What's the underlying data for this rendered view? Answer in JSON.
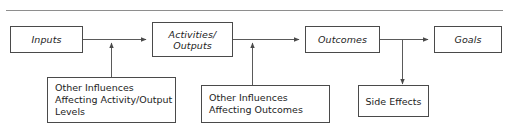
{
  "diagram": {
    "title_partial": "",
    "stages": [
      {
        "id": "inputs",
        "label": "Inputs"
      },
      {
        "id": "activities",
        "label": "Activities/\nOutputs"
      },
      {
        "id": "outcomes",
        "label": "Outcomes"
      },
      {
        "id": "goals",
        "label": "Goals"
      }
    ],
    "influences": [
      {
        "id": "influences-activity",
        "label": "Other Influences\nAffecting Activity/Output\nLevels"
      },
      {
        "id": "influences-outcomes",
        "label": "Other Influences\nAffecting Outcomes"
      }
    ],
    "side_effects": {
      "id": "side-effects",
      "label": "Side Effects"
    },
    "connectors": [
      {
        "from": "inputs",
        "to": "activities",
        "direction": "right"
      },
      {
        "from": "activities",
        "to": "outcomes",
        "direction": "right"
      },
      {
        "from": "outcomes",
        "to": "goals",
        "direction": "right"
      },
      {
        "from": "influences-activity",
        "to": "inputs-activities-link",
        "direction": "up"
      },
      {
        "from": "influences-outcomes",
        "to": "activities-outcomes-link",
        "direction": "up"
      },
      {
        "from": "outcomes-goals-link",
        "to": "side-effects",
        "direction": "down"
      }
    ],
    "colors": {
      "box_border": "#4a4a4a",
      "line": "#5a5a5a",
      "rule": "#8e8e8e",
      "text": "#1d1d1d",
      "background": "#ffffff"
    }
  }
}
